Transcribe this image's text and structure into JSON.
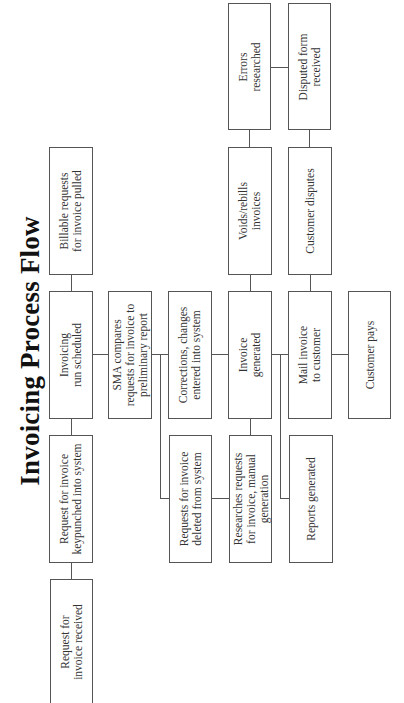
{
  "title": "Invoicing Process Flow",
  "nodes": {
    "request_received": "Request for\ninvoice received",
    "request_keypunched": "Request for invoice\nkeypunched into system",
    "invoicing_run_scheduled": "Invoicing\nrun scheduled",
    "billable_requests_pulled": "Billable requests\nfor invoice pulled",
    "sma_compares": "SMA compares\nrequests for invoice to\npreliminary report",
    "requests_deleted": "Requests for invoice\ndeleted from system",
    "corrections_entered": "Corrections, changes\nentered into system",
    "researches_requests": "Researches requests\nfor invoice, manual\ngeneration",
    "invoice_generated": "Invoice\ngenerated",
    "voids_rebills": "Voids/rebills\ninvoices",
    "errors_researched": "Errors\nresearched",
    "reports_generated": "Reports generated",
    "mail_invoice": "Mail invoice\nto customer",
    "customer_disputes": "Customer disputes",
    "disputed_form_received": "Disputed form\nreceived",
    "customer_pays": "Customer pays"
  },
  "colors": {
    "border": "#555555",
    "text": "#333333",
    "background": "#ffffff"
  }
}
